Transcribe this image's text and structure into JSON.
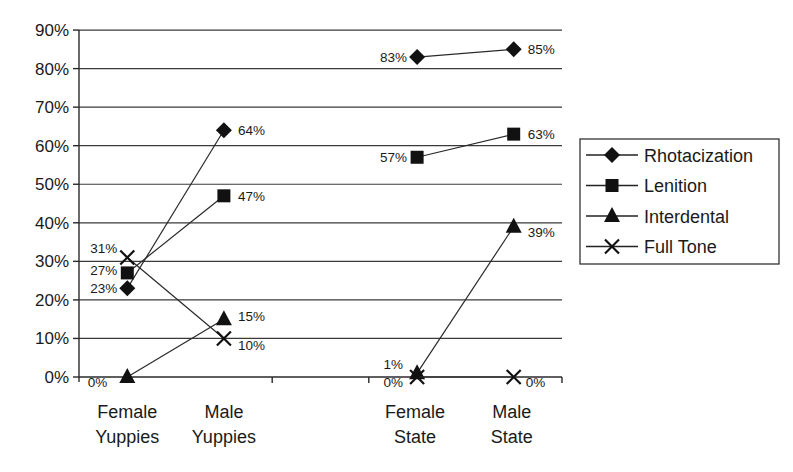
{
  "chart_data": {
    "type": "line",
    "title": "",
    "xlabel": "",
    "ylabel": "",
    "ylim": [
      0,
      90
    ],
    "yticks": [
      "0%",
      "10%",
      "20%",
      "30%",
      "40%",
      "50%",
      "60%",
      "70%",
      "80%",
      "90%"
    ],
    "grid": true,
    "legend_position": "right",
    "categories": [
      {
        "line1": "Female",
        "line2": "Yuppies"
      },
      {
        "line1": "Male",
        "line2": "Yuppies"
      },
      {
        "line1": "",
        "line2": ""
      },
      {
        "line1": "Female",
        "line2": "State"
      },
      {
        "line1": "Male",
        "line2": "State"
      }
    ],
    "series": [
      {
        "name": "Rhotacization",
        "marker": "diamond",
        "segments": [
          [
            {
              "x": 0,
              "y": 23,
              "label": "23%"
            },
            {
              "x": 1,
              "y": 64,
              "label": "64%"
            }
          ],
          [
            {
              "x": 3,
              "y": 83,
              "label": "83%"
            },
            {
              "x": 4,
              "y": 85,
              "label": "85%"
            }
          ]
        ]
      },
      {
        "name": "Lenition",
        "marker": "square",
        "segments": [
          [
            {
              "x": 0,
              "y": 27,
              "label": "27%"
            },
            {
              "x": 1,
              "y": 47,
              "label": "47%"
            }
          ],
          [
            {
              "x": 3,
              "y": 57,
              "label": "57%"
            },
            {
              "x": 4,
              "y": 63,
              "label": "63%"
            }
          ]
        ]
      },
      {
        "name": "Interdental",
        "marker": "triangle",
        "segments": [
          [
            {
              "x": 0,
              "y": 0,
              "label": "0%"
            },
            {
              "x": 1,
              "y": 15,
              "label": "15%"
            }
          ],
          [
            {
              "x": 3,
              "y": 1,
              "label": "1%"
            },
            {
              "x": 4,
              "y": 39,
              "label": "39%"
            }
          ]
        ]
      },
      {
        "name": "Full Tone",
        "marker": "x",
        "segments": [
          [
            {
              "x": 0,
              "y": 31,
              "label": "31%"
            },
            {
              "x": 1,
              "y": 10,
              "label": "10%"
            }
          ],
          [
            {
              "x": 3,
              "y": 0,
              "label": "0%"
            },
            {
              "x": 4,
              "y": 0,
              "label": "0%"
            }
          ]
        ]
      }
    ]
  }
}
